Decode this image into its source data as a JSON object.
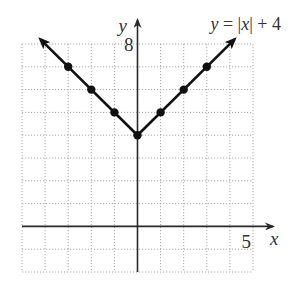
{
  "chart_data": {
    "type": "line",
    "title": "y = |x| + 4",
    "title_parts": {
      "lhs": "y",
      "eq": " = |",
      "var": "x",
      "rhs": "| + 4"
    },
    "xlabel": "x",
    "ylabel": "y",
    "xlim": [
      -5,
      5
    ],
    "ylim": [
      -2,
      8
    ],
    "grid": true,
    "grid_step": 1,
    "tick_labels": {
      "x": [
        {
          "value": 5,
          "label": "5"
        }
      ],
      "y": [
        {
          "value": 8,
          "label": "8"
        }
      ]
    },
    "series": [
      {
        "name": "y = |x| + 4",
        "x": [
          -4,
          0,
          4
        ],
        "y": [
          8,
          4,
          8
        ],
        "line_extends_with_arrows": true,
        "arrow_endpoints": [
          [
            -4.2,
            8.2
          ],
          [
            4.2,
            8.2
          ]
        ],
        "marked_points": [
          [
            -3,
            7
          ],
          [
            -2,
            6
          ],
          [
            -1,
            5
          ],
          [
            0,
            4
          ],
          [
            1,
            5
          ],
          [
            2,
            6
          ],
          [
            3,
            7
          ]
        ]
      }
    ],
    "legend": "none",
    "annotation_placement": "top-right"
  },
  "colors": {
    "curve": "#111111",
    "axis": "#2a2a2a",
    "grid": "#a8a8a8"
  }
}
